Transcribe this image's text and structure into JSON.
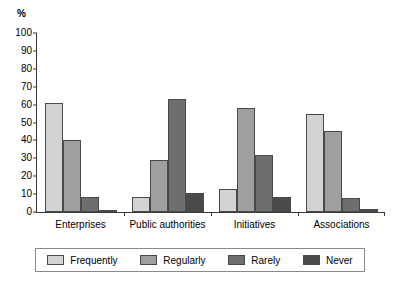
{
  "chart_data": {
    "type": "bar",
    "title": "",
    "subtitle": "",
    "xlabel": "",
    "ylabel": "%",
    "ylim": [
      0,
      100
    ],
    "ytick_step": 10,
    "yticks": [
      100,
      90,
      80,
      70,
      60,
      50,
      40,
      30,
      20,
      10,
      0
    ],
    "grid": false,
    "legend_position": "bottom",
    "categories": [
      "Enterprises",
      "Public authorities",
      "Initiatives",
      "Associations"
    ],
    "series": [
      {
        "name": "Frequently",
        "color": "#d2d2d2",
        "values": [
          61,
          8.5,
          13,
          55
        ]
      },
      {
        "name": "Regularly",
        "color": "#9f9f9f",
        "values": [
          40,
          29,
          58,
          45
        ]
      },
      {
        "name": "Rarely",
        "color": "#6e6e6e",
        "values": [
          8.5,
          63,
          32,
          8
        ]
      },
      {
        "name": "Never",
        "color": "#4a4a4a",
        "values": [
          1,
          10.5,
          8.5,
          1.5
        ]
      }
    ]
  },
  "axis": {
    "unit_label": "%"
  },
  "legend": {
    "items": [
      {
        "label": "Frequently"
      },
      {
        "label": "Regularly"
      },
      {
        "label": "Rarely"
      },
      {
        "label": "Never"
      }
    ]
  }
}
